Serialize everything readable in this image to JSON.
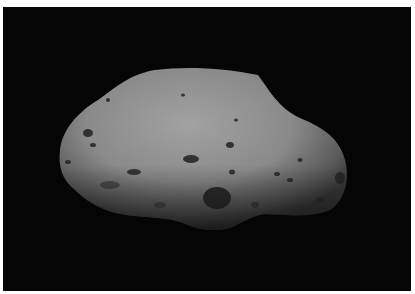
{
  "image": {
    "subject": "asteroid",
    "description": "Irregular grey cratered asteroid on a black space background",
    "colors": {
      "background": "#050505",
      "surface_light": "#9a9a9a",
      "surface_mid": "#7a7a7a",
      "surface_dark": "#3a3a3a",
      "crater": "#1e1e1e"
    }
  }
}
